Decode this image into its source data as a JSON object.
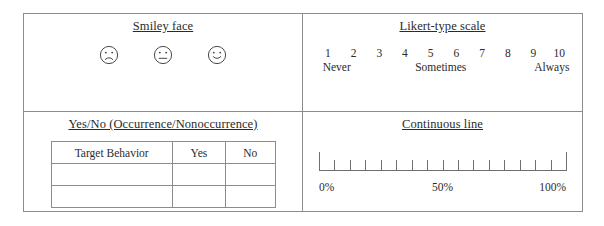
{
  "figure": {
    "panels": {
      "smiley": {
        "title": "Smiley face",
        "faces": [
          {
            "name": "sad-face-icon",
            "mood": "sad"
          },
          {
            "name": "neutral-face-icon",
            "mood": "neutral"
          },
          {
            "name": "happy-face-icon",
            "mood": "happy"
          }
        ]
      },
      "likert": {
        "title": "Likert-type scale",
        "numbers": [
          "1",
          "2",
          "3",
          "4",
          "5",
          "6",
          "7",
          "8",
          "9",
          "10"
        ],
        "anchors": {
          "low": "Never",
          "mid": "Sometimes",
          "high": "Always"
        }
      },
      "yesno": {
        "title": "Yes/No (Occurrence/Nonoccurrence)",
        "columns": [
          "Target Behavior",
          "Yes",
          "No"
        ],
        "rows": [
          [
            "",
            "",
            ""
          ],
          [
            "",
            "",
            ""
          ]
        ]
      },
      "continuous": {
        "title": "Continuous line",
        "labels": {
          "start": "0%",
          "middle": "50%",
          "end": "100%"
        },
        "tick_count": 17
      }
    }
  },
  "colors": {
    "border": "#8c8c8c",
    "ink": "#2b2b2b",
    "rule": "#6f6f6f",
    "background": "#ffffff"
  }
}
